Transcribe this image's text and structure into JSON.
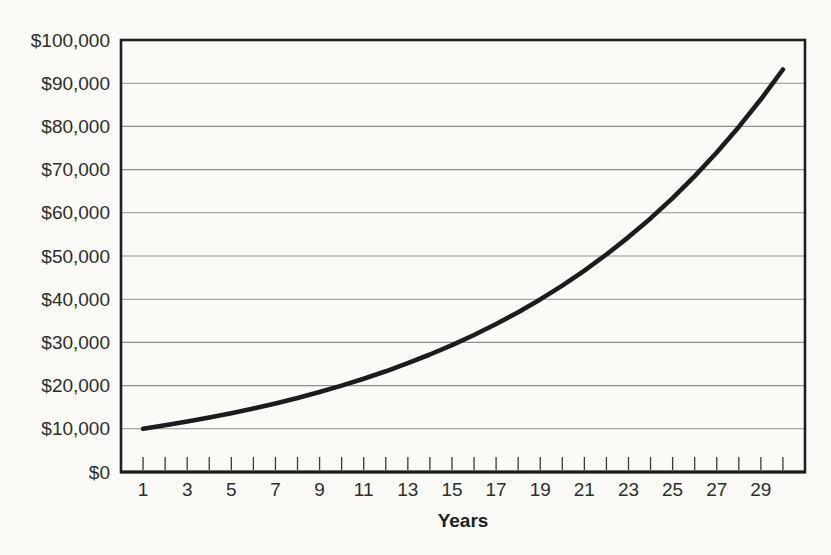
{
  "chart_data": {
    "type": "line",
    "title": "",
    "xlabel": "Years",
    "ylabel": "",
    "x": [
      1,
      2,
      3,
      4,
      5,
      6,
      7,
      8,
      9,
      10,
      11,
      12,
      13,
      14,
      15,
      16,
      17,
      18,
      19,
      20,
      21,
      22,
      23,
      24,
      25,
      26,
      27,
      28,
      29,
      30
    ],
    "values": [
      10000,
      10800,
      11664,
      12597,
      13605,
      14693,
      15869,
      17138,
      18509,
      19990,
      21589,
      23316,
      25182,
      27196,
      29372,
      31722,
      34259,
      37000,
      39960,
      43157,
      46610,
      50338,
      54365,
      58715,
      63412,
      68485,
      73964,
      79881,
      86271,
      93173
    ],
    "xlim": [
      0,
      31
    ],
    "ylim": [
      0,
      100000
    ],
    "y_ticks": [
      0,
      10000,
      20000,
      30000,
      40000,
      50000,
      60000,
      70000,
      80000,
      90000,
      100000
    ],
    "y_tick_labels": [
      "$0",
      "$10,000",
      "$20,000",
      "$30,000",
      "$40,000",
      "$50,000",
      "$60,000",
      "$70,000",
      "$80,000",
      "$90,000",
      "$100,000"
    ],
    "x_ticks": [
      1,
      2,
      3,
      4,
      5,
      6,
      7,
      8,
      9,
      10,
      11,
      12,
      13,
      14,
      15,
      16,
      17,
      18,
      19,
      20,
      21,
      22,
      23,
      24,
      25,
      26,
      27,
      28,
      29,
      30
    ],
    "x_labeled_ticks": [
      1,
      3,
      5,
      7,
      9,
      11,
      13,
      15,
      17,
      19,
      21,
      23,
      25,
      27,
      29
    ],
    "grid": "horizontal",
    "legend": "none",
    "colors": {
      "line": "#1c1c1c",
      "grid": "#8f8f8f",
      "axis": "#1f1f1f",
      "tick": "#3a3a3a",
      "text": "#2d2d2d",
      "background": "#fbfaf7"
    }
  }
}
